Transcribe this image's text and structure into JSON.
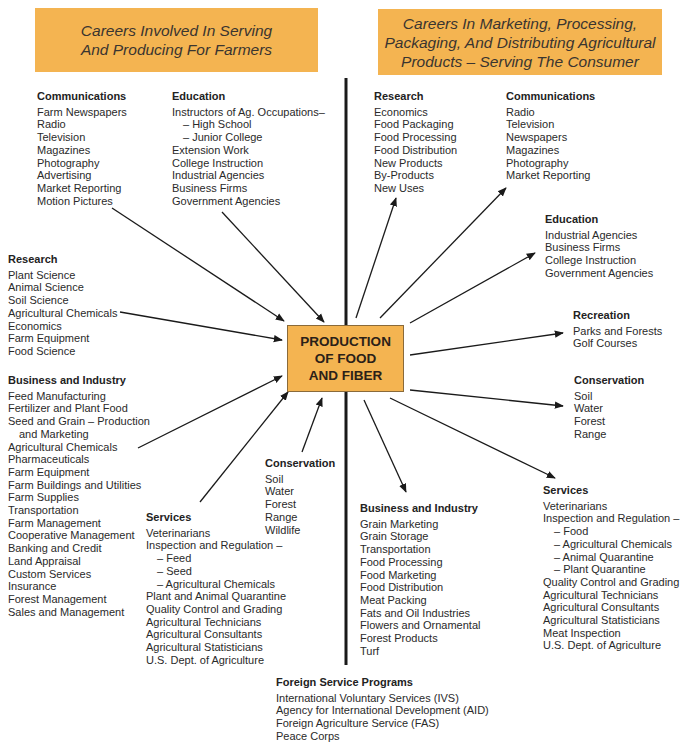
{
  "banners": {
    "left": [
      "Careers Involved In Serving",
      "And Producing For Farmers"
    ],
    "right": [
      "Careers In Marketing, Processing,",
      "Packaging, And Distributing Agricultural",
      "Products – Serving The Consumer"
    ]
  },
  "center": [
    "PRODUCTION",
    "OF FOOD",
    "AND FIBER"
  ],
  "left_groups": {
    "communications": {
      "title": "Communications",
      "items": [
        "Farm Newspapers",
        "Radio",
        "Television",
        "Magazines",
        "Photography",
        "Advertising",
        "Market Reporting",
        "Motion Pictures"
      ]
    },
    "education": {
      "title": "Education",
      "items": [
        "Instructors of Ag. Occupations–",
        "– High School",
        "– Junior College",
        "Extension Work",
        "College Instruction",
        "Industrial Agencies",
        "Business Firms",
        "Government Agencies"
      ]
    },
    "research": {
      "title": "Research",
      "items": [
        "Plant Science",
        "Animal Science",
        "Soil Science",
        "Agricultural Chemicals",
        "Economics",
        "Farm Equipment",
        "Food Science"
      ]
    },
    "business": {
      "title": "Business and Industry",
      "items": [
        "Feed Manufacturing",
        "Fertilizer and Plant Food",
        "Seed and Grain – Production",
        "and Marketing",
        "Agricultural Chemicals",
        "Pharmaceuticals",
        "Farm Equipment",
        "Farm Buildings and Utilities",
        "Farm Supplies",
        "Transportation",
        "Farm Management",
        "Cooperative Management",
        "Banking and Credit",
        "Land Appraisal",
        "Custom Services",
        "Insurance",
        "Forest Management",
        "Sales and Management"
      ]
    },
    "conservation": {
      "title": "Conservation",
      "items": [
        "Soil",
        "Water",
        "Forest",
        "Range",
        "Wildlife"
      ]
    },
    "services": {
      "title": "Services",
      "items": [
        "Veterinarians",
        "Inspection and Regulation –",
        "– Feed",
        "– Seed",
        "– Agricultural Chemicals",
        "Plant and Animal Quarantine",
        "Quality Control and Grading",
        "Agricultural Technicians",
        "Agricultural Consultants",
        "Agricultural Statisticians",
        "U.S. Dept. of Agriculture"
      ]
    }
  },
  "right_groups": {
    "research": {
      "title": "Research",
      "items": [
        "Economics",
        "Food Packaging",
        "Food Processing",
        "Food Distribution",
        "New Products",
        "By-Products",
        "New Uses"
      ]
    },
    "communications": {
      "title": "Communications",
      "items": [
        "Radio",
        "Television",
        "Newspapers",
        "Magazines",
        "Photography",
        "Market Reporting"
      ]
    },
    "education": {
      "title": "Education",
      "items": [
        "Industrial Agencies",
        "Business Firms",
        "College Instruction",
        "Government Agencies"
      ]
    },
    "recreation": {
      "title": "Recreation",
      "items": [
        "Parks and Forests",
        "Golf Courses"
      ]
    },
    "conservation": {
      "title": "Conservation",
      "items": [
        "Soil",
        "Water",
        "Forest",
        "Range"
      ]
    },
    "business": {
      "title": "Business and Industry",
      "items": [
        "Grain Marketing",
        "Grain Storage",
        "Transportation",
        "Food Processing",
        "Food Marketing",
        "Food Distribution",
        "Meat Packing",
        "Fats and Oil Industries",
        "Flowers and Ornamental",
        "Forest Products",
        "Turf"
      ]
    },
    "services": {
      "title": "Services",
      "items": [
        "Veterinarians",
        "Inspection and Regulation –",
        "– Food",
        "– Agricultural Chemicals",
        "– Animal Quarantine",
        "– Plant Quarantine",
        "Quality Control and Grading",
        "Agricultural Technicians",
        "Agricultural Consultants",
        "Agricultural Statisticians",
        "Meat Inspection",
        "U.S. Dept. of Agriculture"
      ]
    }
  },
  "foreign": {
    "title": "Foreign Service Programs",
    "items": [
      "International Voluntary Services (IVS)",
      "Agency for International Development (AID)",
      "Foreign Agriculture Service (FAS)",
      "Peace Corps"
    ]
  },
  "colors": {
    "banner": "#f4b451",
    "line": "#1a1a1a"
  }
}
